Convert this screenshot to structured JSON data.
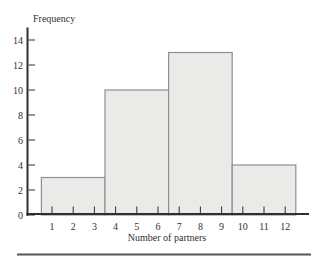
{
  "chart_data": {
    "type": "bar",
    "subtype": "histogram",
    "title": "",
    "ylabel": "Frequency",
    "xlabel": "Number of partners",
    "x_ticks": [
      1,
      2,
      3,
      4,
      5,
      6,
      7,
      8,
      9,
      10,
      11,
      12
    ],
    "y_ticks": [
      0,
      2,
      4,
      6,
      8,
      10,
      12,
      14
    ],
    "xlim": [
      0.5,
      12.5
    ],
    "ylim": [
      0,
      15
    ],
    "grid": false,
    "legend": "none",
    "bins": [
      {
        "x_start": 0.5,
        "x_end": 3.5,
        "label": "1-3",
        "frequency": 3
      },
      {
        "x_start": 3.5,
        "x_end": 6.5,
        "label": "4-6",
        "frequency": 10
      },
      {
        "x_start": 6.5,
        "x_end": 9.5,
        "label": "7-9",
        "frequency": 13
      },
      {
        "x_start": 9.5,
        "x_end": 12.5,
        "label": "10-12",
        "frequency": 4
      }
    ],
    "colors": {
      "background": "#ffffff",
      "bar_fill": "#eaeae8",
      "bar_stroke": "#8f8f8f",
      "axis": "#2f2f2f",
      "text": "#2f2f2f",
      "divider": "#565656"
    }
  }
}
